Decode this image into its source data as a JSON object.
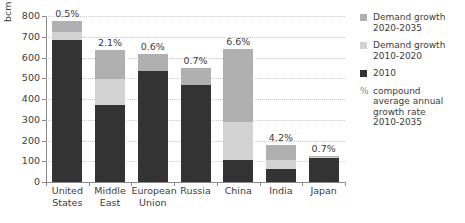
{
  "chart_data": {
    "type": "bar",
    "subtype": "stacked-bar",
    "title": "",
    "xlabel": "",
    "ylabel": "bcm",
    "ylim": [
      0,
      800
    ],
    "yticks": [
      0,
      100,
      200,
      300,
      400,
      500,
      600,
      700,
      800
    ],
    "grid": true,
    "legend_position": "right",
    "categories": [
      "United States",
      "Middle East",
      "European Union",
      "Russia",
      "China",
      "India",
      "Japan"
    ],
    "series": [
      {
        "name": "2010",
        "color": "#333333",
        "values": [
          683,
          373,
          537,
          468,
          105,
          63,
          115
        ]
      },
      {
        "name": "Demand growth 2010-2020",
        "color": "#d2d2d2",
        "values": [
          42,
          122,
          0,
          0,
          185,
          45,
          4
        ]
      },
      {
        "name": "Demand growth 2020-2035",
        "color": "#b0b0b0",
        "values": [
          50,
          140,
          81,
          80,
          350,
          72,
          6
        ]
      }
    ],
    "annotations": {
      "label": "compound average annual growth rate 2010-2035",
      "values": [
        "0.5%",
        "2.1%",
        "0.6%",
        "0.7%",
        "6.6%",
        "4.2%",
        "0.7%"
      ]
    }
  },
  "axis": {
    "y_title": "bcm",
    "y_tick_labels": [
      "800",
      "700",
      "600",
      "500",
      "400",
      "300",
      "200",
      "100",
      "0"
    ],
    "x_tick_labels": [
      [
        "United",
        "States"
      ],
      [
        "Middle",
        "East"
      ],
      [
        "European",
        "Union"
      ],
      [
        "Russia",
        ""
      ],
      [
        "China",
        ""
      ],
      [
        "India",
        ""
      ],
      [
        "Japan",
        ""
      ]
    ]
  },
  "legend": {
    "items": [
      {
        "swatch": "medium-gray-square",
        "color": "#b0b0b0",
        "line1": "Demand growth",
        "line2": "2020-2035"
      },
      {
        "swatch": "light-gray-square",
        "color": "#d2d2d2",
        "line1": "Demand growth",
        "line2": "2010-2020"
      },
      {
        "swatch": "dark-square",
        "color": "#333333",
        "line1": "2010",
        "line2": ""
      },
      {
        "swatch": "percent-glyph",
        "color": "#8a8a8a",
        "line1": "compound",
        "line2": "average annual",
        "line3": "growth rate",
        "line4": "2010-2035"
      }
    ]
  }
}
